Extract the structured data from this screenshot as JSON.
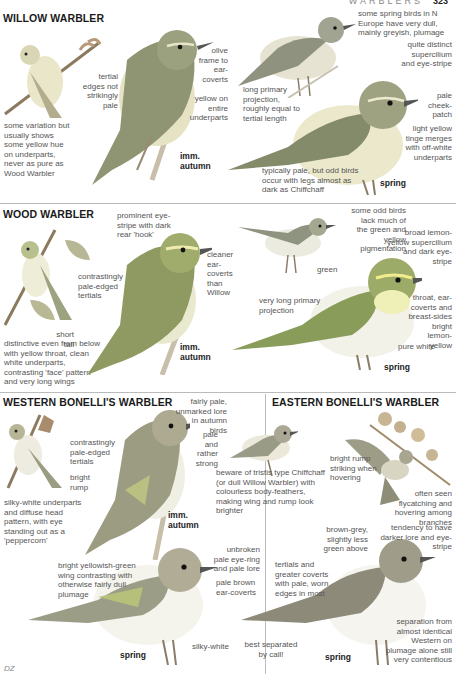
{
  "page_header": {
    "section": "WARBLERS",
    "page_number": "323"
  },
  "species": [
    {
      "name": "WILLOW WARBLER",
      "notes": [
        "some variation but usually shows some yellow hue on underparts, never as pure as Wood Warbler",
        "tertial edges not strikingly pale",
        "olive frame to ear-coverts",
        "yellow on entire underparts",
        "some spring birds in N Europe have very dull, mainly greyish, plumage",
        "quite distinct supercilium and eye-stripe",
        "pale cheek-patch",
        "light yellow tinge merges with off-white underparts",
        "long primary projection, roughly equal to tertial length",
        "typically pale, but odd birds occur with legs almost as dark as Chiffchaff"
      ],
      "ages": [
        "imm. autumn",
        "spring"
      ]
    },
    {
      "name": "WOOD WARBLER",
      "notes": [
        "prominent eye-stripe with dark rear 'hook'",
        "cleaner ear-coverts than Willow",
        "contrastingly pale-edged tertials",
        "short tail",
        "distinctive even from below with yellow throat, clean white underparts, contrasting 'face' pattern and very long wings",
        "some odd birds lack much of the green and yellow pigmentation",
        "broad lemon-yellow supercilium and dark eye-stripe",
        "green",
        "very long primary projection",
        "throat, ear-coverts and breast-sides bright lemon-yellow",
        "pure white"
      ],
      "ages": [
        "imm. autumn",
        "spring"
      ]
    },
    {
      "name": "WESTERN BONELLI'S WARBLER",
      "notes": [
        "fairly pale, unmarked lore in autumn birds",
        "pale and rather strong",
        "contrastingly pale-edged tertials",
        "bright rump",
        "silky-white underparts and diffuse head pattern, with eye standing out as a 'peppercorn'",
        "beware of tristis type Chiffchaff (or dull Willow Warbler) with colourless body-feathers, making wing and rump look brighter",
        "bright yellowish-green wing contrasting with otherwise fairly dull plumage",
        "unbroken pale eye-ring and pale lore",
        "pale brown ear-coverts",
        "silky-white",
        "best separated by call!"
      ],
      "ages": [
        "imm. autumn",
        "spring"
      ]
    },
    {
      "name": "EASTERN BONELLI'S WARBLER",
      "notes": [
        "bright rump striking when hovering",
        "often seen flycatching and hovering among branches",
        "brown-grey, slightly less green above",
        "tendency to have darker lore and eye-stripe",
        "tertials and greater coverts with pale, worn edges in most",
        "separation from almost identical Western on plumage alone still very contentious"
      ],
      "ages": [
        "spring"
      ]
    }
  ],
  "artist_signature": "DZ",
  "colors": {
    "olive": "#8a9a5b",
    "grey_green": "#9aa08a",
    "yellow": "#e9e6b8",
    "white": "#f5f4ee",
    "branch": "#b8a98c"
  }
}
